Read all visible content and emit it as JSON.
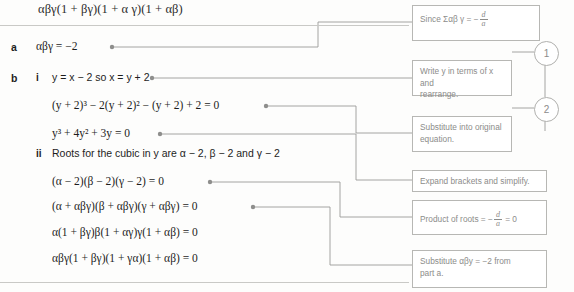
{
  "page": {
    "top_formula": "αβγ(1 + βγ)(1 + α γ)(1 + αβ)"
  },
  "working": {
    "part_a_label": "a",
    "part_b_label": "b",
    "roman_i": "i",
    "roman_ii": "ii",
    "lines": [
      {
        "id": "a1",
        "text": "αβγ = −2"
      },
      {
        "id": "bi1",
        "text": "y = x − 2 so x = y + 2"
      },
      {
        "id": "bi2",
        "text": "(y + 2)³ − 2(y + 2)² − (y + 2) + 2 = 0"
      },
      {
        "id": "bi3",
        "text": "y³ + 4y² + 3y = 0"
      },
      {
        "id": "bii0",
        "text": "Roots for the cubic in y are α − 2, β − 2 and γ − 2"
      },
      {
        "id": "bii1",
        "text": "(α − 2)(β − 2)(γ − 2) = 0"
      },
      {
        "id": "bii2",
        "text": "(α + αβγ)(β + αβγ)(γ + αβγ) = 0"
      },
      {
        "id": "bii3",
        "text": "α(1 + βγ)β(1 + αγ)γ(1 + αβ) = 0"
      },
      {
        "id": "bii4",
        "text": "αβγ(1 + βγ)(1 + γα)(1 + αβ) = 0"
      }
    ]
  },
  "callouts": [
    {
      "id": "c1",
      "lead": "Since Σαβ γ = ",
      "frac_num": "d",
      "frac_den": "a",
      "minus": "−",
      "tail": "",
      "plain": "Since Σαβ γ = −d/a"
    },
    {
      "id": "c2",
      "line1": "Write y in terms of x and",
      "line2": "rearrange.",
      "plain": "Write y in terms of x and rearrange."
    },
    {
      "id": "c3",
      "line1": "Substitute into original",
      "line2": "equation.",
      "plain": "Substitute into original equation."
    },
    {
      "id": "c4",
      "line1": "Expand brackets and simplify.",
      "plain": "Expand brackets and simplify."
    },
    {
      "id": "c5",
      "lead": "Product of roots = ",
      "frac_num": "d",
      "frac_den": "a",
      "minus": "−",
      "tail": " = 0",
      "plain": "Product of roots = −d/a = 0"
    },
    {
      "id": "c6",
      "line1": "Substitute αβy = −2 from",
      "line2": "part a.",
      "plain": "Substitute αβy = −2 from part a."
    }
  ],
  "step_numbers": [
    {
      "id": "s1",
      "label": "1"
    },
    {
      "id": "s2",
      "label": "2"
    }
  ],
  "colors": {
    "page_background": "#fdfdfc",
    "text": "#1d1d1d",
    "callout_text": "#8c8c8a",
    "callout_border": "#b7b7b4",
    "connector": "#9a9a98",
    "rule": "#c9c9c6"
  }
}
